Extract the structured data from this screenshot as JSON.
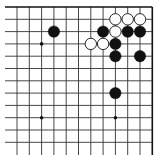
{
  "board": {
    "cols": 12,
    "rows": 12,
    "origin_x": 17,
    "origin_y": 7,
    "spacing": 12.3,
    "open_edges": [
      "left",
      "bottom"
    ],
    "line_color": "#333333",
    "edge_color": "#111111",
    "background": "#ffffff",
    "hoshi": [
      [
        2,
        3
      ],
      [
        2,
        9
      ],
      [
        8,
        9
      ]
    ],
    "stones": [
      {
        "color": "white",
        "col": 8,
        "row": 1
      },
      {
        "color": "white",
        "col": 9,
        "row": 1
      },
      {
        "color": "white",
        "col": 10,
        "row": 1
      },
      {
        "color": "black",
        "col": 3,
        "row": 2
      },
      {
        "color": "black",
        "col": 7,
        "row": 2
      },
      {
        "color": "white",
        "col": 8,
        "row": 2
      },
      {
        "color": "black",
        "col": 9,
        "row": 2
      },
      {
        "color": "black",
        "col": 10,
        "row": 2
      },
      {
        "color": "white",
        "col": 6,
        "row": 3
      },
      {
        "color": "white",
        "col": 7,
        "row": 3
      },
      {
        "color": "black",
        "col": 8,
        "row": 3
      },
      {
        "color": "black",
        "col": 8,
        "row": 4
      },
      {
        "color": "black",
        "col": 10,
        "row": 4
      },
      {
        "color": "black",
        "col": 8,
        "row": 7
      }
    ]
  }
}
